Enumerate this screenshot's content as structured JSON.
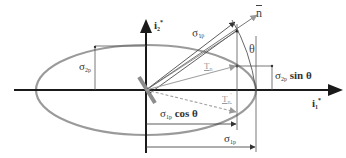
{
  "diagram": {
    "type": "stress-ellipse",
    "colors": {
      "axes": "#1a1a1a",
      "ellipse": "#9a9a9a",
      "construction": "#555555",
      "traction": "#a0a0a0",
      "plane_marker": "#8c8c8c"
    },
    "axes": {
      "horizontal": {
        "symbol": "i",
        "subscript": "1",
        "superscript": "*"
      },
      "vertical": {
        "symbol": "i",
        "subscript": "2",
        "superscript": "*"
      }
    },
    "normal": {
      "symbol": "n",
      "overbar": true
    },
    "angle": {
      "symbol": "θ"
    },
    "labels": {
      "sigma2p": {
        "symbol": "σ",
        "subscript": "2p"
      },
      "sigma1p_diag": {
        "symbol": "σ",
        "subscript": "1p"
      },
      "sigma2p_sin": {
        "symbol": "σ",
        "subscript": "2p",
        "suffix": "sin θ"
      },
      "sigma1p_cos": {
        "symbol": "σ",
        "subscript": "1p",
        "suffix": "cos θ"
      },
      "sigma1p_dim": {
        "symbol": "σ",
        "subscript": "1p"
      },
      "traction": {
        "symbol": "T",
        "subscript": "n"
      },
      "traction_prime": {
        "symbol": "T",
        "subscript": "n",
        "superscript": "'"
      }
    }
  }
}
